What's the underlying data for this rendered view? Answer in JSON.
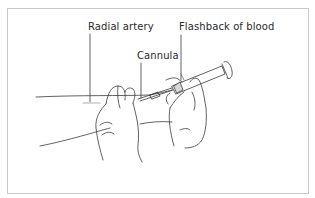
{
  "figure": {
    "labels": {
      "radial_artery": "Radial artery",
      "flashback": "Flashback of blood",
      "cannula": "Cannula"
    },
    "colors": {
      "line": "#3a3a3a",
      "frame": "#c8c8c8",
      "artery": "#b0b0b0"
    }
  }
}
